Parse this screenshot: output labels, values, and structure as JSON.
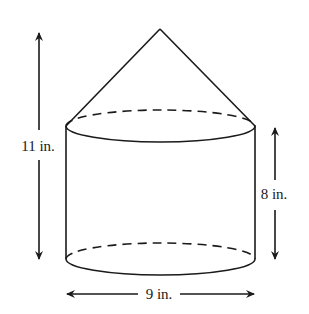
{
  "figure": {
    "labels": {
      "total_height": "11 in.",
      "cylinder_height": "8 in.",
      "diameter": "9 in."
    },
    "dimensions": {
      "total_height_in": 11,
      "cylinder_height_in": 8,
      "diameter_in": 9
    }
  }
}
